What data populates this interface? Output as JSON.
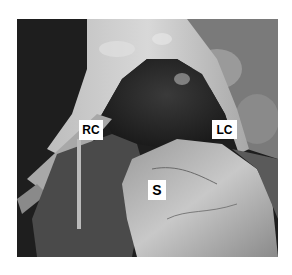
{
  "figure": {
    "labels": [
      {
        "id": "rc",
        "text": "RC"
      },
      {
        "id": "lc",
        "text": "LC"
      },
      {
        "id": "s",
        "text": "S"
      }
    ]
  }
}
